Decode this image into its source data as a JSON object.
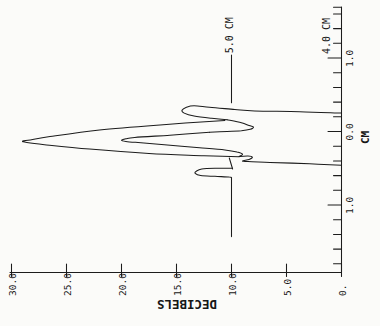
{
  "figure": {
    "background": "#fbfbf9",
    "ink": "#1c1c1c",
    "presentation": "scanned plot rotated 90deg CCW",
    "db_axis": {
      "title": "DECIBELS",
      "ticks": [
        {
          "label": "30.0",
          "db": 30
        },
        {
          "label": "25.0",
          "db": 25
        },
        {
          "label": "20.0",
          "db": 20
        },
        {
          "label": "15.0",
          "db": 15
        },
        {
          "label": "10.0",
          "db": 10
        },
        {
          "label": "5.0",
          "db": 5
        },
        {
          "label": "0.",
          "db": 0
        }
      ]
    },
    "cm_axis": {
      "title": "CM",
      "major_ticks": [
        {
          "label": "1.0",
          "cm": 1.0
        },
        {
          "label": "0.0",
          "cm": 0.0
        },
        {
          "label": "1.0",
          "cm": -1.0
        }
      ],
      "minor_cm": [
        1.69,
        1.6,
        1.4,
        1.2,
        0.8,
        0.6,
        0.4,
        0.2,
        -0.2,
        -0.4,
        -0.6,
        -0.8,
        -1.2,
        -1.4,
        -1.6,
        -1.8
      ]
    },
    "annotations": [
      {
        "text": "5.0 CM",
        "cm": 1.05,
        "db": 9.9
      },
      {
        "text": "4.0 CM",
        "cm": 1.04,
        "db": 1.05
      }
    ]
  },
  "chart_data": {
    "type": "line",
    "title": "",
    "xlabel": "CM",
    "ylabel": "DECIBELS",
    "xlim": [
      -1.92,
      1.69
    ],
    "ylim": [
      0,
      30
    ],
    "x_tick_labels": [
      "1.0",
      "0.0",
      "1.0"
    ],
    "y_tick_labels": [
      "30.0",
      "25.0",
      "20.0",
      "15.0",
      "10.0",
      "5.0",
      "0."
    ],
    "grid": false,
    "legend": "labels written at right end of each trace",
    "series": [
      {
        "name": "5.0 CM",
        "segments": [
          {
            "smooth": false,
            "points": [
              [
                1.04,
                10.0
              ],
              [
                0.39,
                10.0
              ]
            ]
          },
          {
            "smooth": true,
            "points": [
              [
                0.25,
                0.0
              ],
              [
                0.27,
                3.8
              ],
              [
                0.28,
                7.9
              ],
              [
                0.3,
                9.7
              ],
              [
                0.33,
                12.0
              ],
              [
                0.35,
                13.4
              ],
              [
                0.33,
                14.1
              ],
              [
                0.29,
                14.5
              ],
              [
                0.25,
                14.3
              ],
              [
                0.21,
                13.4
              ],
              [
                0.18,
                11.8
              ],
              [
                0.16,
                10.4
              ]
            ]
          },
          {
            "smooth": true,
            "points": [
              [
                0.15,
                10.6
              ],
              [
                0.09,
                16.5
              ],
              [
                0.02,
                22.0
              ],
              [
                -0.07,
                26.5
              ],
              [
                -0.12,
                28.5
              ],
              [
                -0.132,
                29.0
              ],
              [
                -0.15,
                28.6
              ],
              [
                -0.18,
                27.0
              ],
              [
                -0.24,
                22.9
              ],
              [
                -0.3,
                17.5
              ],
              [
                -0.33,
                12.5
              ],
              [
                -0.343,
                9.3
              ]
            ]
          },
          {
            "smooth": true,
            "points": [
              [
                -0.5,
                9.9
              ],
              [
                -0.5,
                11.5
              ],
              [
                -0.51,
                12.7
              ],
              [
                -0.54,
                13.2
              ],
              [
                -0.57,
                13.3
              ],
              [
                -0.6,
                12.8
              ],
              [
                -0.61,
                11.5
              ],
              [
                -0.62,
                10.2
              ],
              [
                -0.63,
                10.0
              ]
            ]
          },
          {
            "smooth": false,
            "points": [
              [
                -0.63,
                10.0
              ],
              [
                -1.43,
                10.0
              ]
            ]
          }
        ]
      },
      {
        "name": "4.0 CM",
        "segments": [
          {
            "smooth": true,
            "points": [
              [
                0.16,
                10.4
              ],
              [
                0.12,
                9.1
              ],
              [
                0.08,
                8.4
              ],
              [
                0.06,
                8.0
              ],
              [
                0.03,
                8.3
              ],
              [
                0.01,
                9.1
              ],
              [
                0.0,
                10.4
              ],
              [
                -0.01,
                12.0
              ]
            ]
          },
          {
            "smooth": true,
            "points": [
              [
                -0.01,
                12.0
              ],
              [
                -0.05,
                15.6
              ],
              [
                -0.08,
                18.8
              ],
              [
                -0.1,
                19.6
              ],
              [
                -0.12,
                20.0
              ],
              [
                -0.135,
                19.6
              ],
              [
                -0.15,
                18.5
              ],
              [
                -0.18,
                16.1
              ],
              [
                -0.22,
                12.9
              ],
              [
                -0.25,
                10.6
              ],
              [
                -0.28,
                9.5
              ],
              [
                -0.31,
                9.0
              ],
              [
                -0.34,
                9.3
              ]
            ]
          },
          {
            "smooth": true,
            "points": [
              [
                -0.34,
                9.3
              ],
              [
                -0.335,
                8.5
              ],
              [
                -0.35,
                8.1
              ],
              [
                -0.38,
                8.4
              ],
              [
                -0.4,
                9.0
              ],
              [
                -0.41,
                8.5
              ],
              [
                -0.42,
                6.5
              ],
              [
                -0.44,
                2.9
              ],
              [
                -0.46,
                0.0
              ]
            ]
          },
          {
            "smooth": false,
            "points": [
              [
                -0.36,
                10.2
              ],
              [
                -0.51,
                9.9
              ]
            ]
          }
        ]
      }
    ]
  },
  "render": {
    "width": 380,
    "height": 326,
    "axis_x": 341.5,
    "axis_y": 272.5,
    "px_per_db": 11.0,
    "px_per_cm": 73.5,
    "cm_zero_y": 131.5,
    "db_axis_left_x": 10,
    "cm_axis_top_y": 7,
    "major_tick_len": 13.5,
    "minor_tick_len": 8,
    "db_tick_up": 8.5,
    "db_tick_down": 4,
    "tick_font": 9.5,
    "anno_font": 10,
    "cm_title_font": 11,
    "db_title_font": 12.5,
    "cm_title_pos": {
      "x": 369,
      "y": 144
    },
    "db_title_pos": {
      "x": 187,
      "y": 308
    },
    "stroke_w": 1.05
  }
}
